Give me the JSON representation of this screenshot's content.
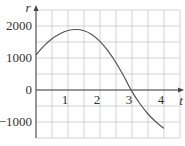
{
  "chart_data": {
    "type": "line",
    "title": "",
    "xlabel": "t",
    "ylabel": "r",
    "xlim": [
      0,
      4.5
    ],
    "ylim": [
      -1500,
      2500
    ],
    "x_ticks": [
      0,
      1,
      2,
      3,
      4
    ],
    "x_tick_labels": [
      "0",
      "1",
      "2",
      "3",
      "4"
    ],
    "y_ticks": [
      -1000,
      0,
      1000,
      2000
    ],
    "y_tick_labels": [
      "−1000",
      "0",
      "1000",
      "2000"
    ],
    "grid": true,
    "grid_step_x": 0.5,
    "grid_step_y": 500,
    "legend": null,
    "series": [
      {
        "name": "r(t)",
        "x": [
          0,
          0.25,
          0.5,
          0.75,
          1.0,
          1.25,
          1.5,
          1.75,
          2.0,
          2.25,
          2.5,
          2.75,
          3.0,
          3.25,
          3.5,
          3.75,
          4.0
        ],
        "y": [
          1100,
          1380,
          1600,
          1760,
          1860,
          1890,
          1850,
          1730,
          1520,
          1220,
          850,
          420,
          -50,
          -430,
          -750,
          -1000,
          -1200
        ]
      }
    ]
  },
  "colors": {
    "grid": "#c8c8c8",
    "axis": "#444444",
    "curve": "#555555",
    "text": "#333333"
  }
}
